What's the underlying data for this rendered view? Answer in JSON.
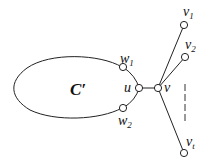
{
  "diagram": {
    "type": "graph",
    "cycle_label": "C′",
    "nodes": [
      {
        "id": "w1",
        "label": "w",
        "sub": "1"
      },
      {
        "id": "u",
        "label": "u",
        "sub": ""
      },
      {
        "id": "w2",
        "label": "w",
        "sub": "2"
      },
      {
        "id": "v",
        "label": "v",
        "sub": ""
      },
      {
        "id": "v1",
        "label": "v",
        "sub": "1"
      },
      {
        "id": "v2",
        "label": "v",
        "sub": "2"
      },
      {
        "id": "vt",
        "label": "v",
        "sub": "t"
      }
    ],
    "edges": [
      [
        "u",
        "v"
      ],
      [
        "v",
        "v1"
      ],
      [
        "v",
        "v2"
      ],
      [
        "v",
        "vt"
      ]
    ],
    "ellipsis": "vertical dashes between v2 and vt"
  }
}
